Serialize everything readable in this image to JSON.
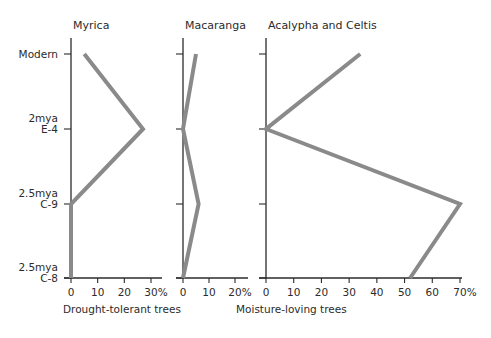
{
  "chart_data": {
    "type": "line",
    "orientation": "horizontal-values-vertical-categories",
    "categories": [
      "Modern",
      "2mya E-4",
      "2.5mya C-9",
      "2.5mya C-8"
    ],
    "category_labels": [
      {
        "line1": "Modern",
        "line2": ""
      },
      {
        "line1": "2mya",
        "line2": "E-4"
      },
      {
        "line1": "2.5mya",
        "line2": "C-9"
      },
      {
        "line1": "2.5mya",
        "line2": "C-8"
      }
    ],
    "series": [
      {
        "name": "Myrica",
        "values": [
          5,
          27,
          0,
          0
        ],
        "xlim": [
          0,
          30
        ],
        "ticks": [
          "0",
          "10",
          "20",
          "30%"
        ],
        "group": "Drought-tolerant trees"
      },
      {
        "name": "Macaranga",
        "values": [
          5,
          0,
          6,
          0
        ],
        "xlim": [
          0,
          20
        ],
        "ticks": [
          "0",
          "10",
          "20%"
        ],
        "group": "Moisture-loving trees"
      },
      {
        "name": "Acalypha and Celtis",
        "values": [
          34,
          0,
          70,
          52
        ],
        "xlim": [
          0,
          70
        ],
        "ticks": [
          "0",
          "10",
          "20",
          "30",
          "40",
          "50",
          "60",
          "70%"
        ],
        "group": "Moisture-loving trees"
      }
    ],
    "group_labels": [
      "Drought-tolerant trees",
      "Moisture-loving trees"
    ],
    "line_color": "#8a8a8a",
    "axis_color": "#2b2b2b",
    "grid": false,
    "legend": "none"
  }
}
